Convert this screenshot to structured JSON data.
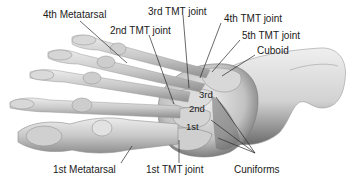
{
  "figure": {
    "colors": {
      "background": "#ffffff",
      "bone_light": "#e6e6e6",
      "bone_mid": "#c4c4c4",
      "bone_dark": "#8a8a8a",
      "shadow": "#3a3a3a",
      "leader_line": "#2a2a2a",
      "text": "#1a1a1a"
    },
    "labels": {
      "metatarsal_4": "4th Metatarsal",
      "tmt_joint_3": "3rd TMT joint",
      "tmt_joint_4": "4th TMT joint",
      "tmt_joint_2": "2nd TMT joint",
      "tmt_joint_5": "5th TMT joint",
      "cuboid": "Cuboid",
      "metatarsal_1": "1st Metatarsal",
      "tmt_joint_1": "1st TMT joint",
      "cuniforms": "Cuniforms"
    },
    "bone_labels": {
      "cuneiform_3": "3rd",
      "cuneiform_2": "2nd",
      "cuneiform_1": "1st"
    }
  }
}
